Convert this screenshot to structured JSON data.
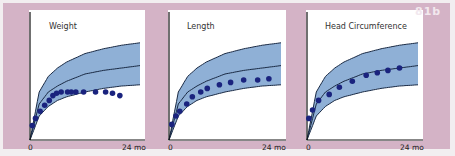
{
  "figure": {
    "tag": "81b",
    "colors": {
      "background": "#d4b3c6",
      "band": "#8fb0d6",
      "curve": "#1a2a44",
      "dots": "#1a237e",
      "plot_bg": "#ffffff"
    }
  },
  "chart_data": [
    {
      "type": "line",
      "title": "Weight",
      "xlabel": "",
      "x_ticks": [
        "0",
        "24 mo"
      ],
      "xlim": [
        0,
        24
      ],
      "ylabel": "",
      "grid": false,
      "legend": "none",
      "series": [
        {
          "name": "upper percentile",
          "x": [
            0,
            2,
            4,
            6,
            8,
            12,
            16,
            20,
            24
          ],
          "y": [
            0,
            40,
            53,
            60,
            65,
            72,
            76,
            79,
            81
          ]
        },
        {
          "name": "median",
          "x": [
            0,
            2,
            4,
            6,
            8,
            12,
            16,
            20,
            24
          ],
          "y": [
            0,
            30,
            40,
            45,
            49,
            55,
            58,
            60,
            62
          ]
        },
        {
          "name": "lower percentile",
          "x": [
            0,
            2,
            4,
            6,
            8,
            12,
            16,
            20,
            24
          ],
          "y": [
            0,
            20,
            28,
            33,
            36,
            40,
            43,
            45,
            46
          ]
        },
        {
          "name": "patient measurements",
          "kind": "scatter",
          "x": [
            0.5,
            1.2,
            2.2,
            3.2,
            4.2,
            5.0,
            5.8,
            6.8,
            8.2,
            9.0,
            10.0,
            11.7,
            14.3,
            16.5,
            18.0,
            19.6
          ],
          "y": [
            12,
            18,
            24,
            29,
            33,
            37,
            39,
            40,
            40,
            40,
            40,
            40,
            40,
            40,
            39,
            37
          ]
        }
      ],
      "band": "shaded region between upper and lower percentile"
    },
    {
      "type": "line",
      "title": "Length",
      "xlabel": "",
      "x_ticks": [
        "0",
        "24 mo"
      ],
      "xlim": [
        0,
        24
      ],
      "grid": false,
      "legend": "none",
      "series": [
        {
          "name": "upper percentile",
          "x": [
            0,
            2,
            4,
            6,
            8,
            12,
            16,
            20,
            24
          ],
          "y": [
            0,
            40,
            53,
            60,
            65,
            72,
            76,
            79,
            81
          ]
        },
        {
          "name": "median",
          "x": [
            0,
            2,
            4,
            6,
            8,
            12,
            16,
            20,
            24
          ],
          "y": [
            0,
            30,
            40,
            45,
            49,
            55,
            58,
            60,
            62
          ]
        },
        {
          "name": "lower percentile",
          "x": [
            0,
            2,
            4,
            6,
            8,
            12,
            16,
            20,
            24
          ],
          "y": [
            0,
            20,
            28,
            33,
            36,
            40,
            43,
            45,
            46
          ]
        },
        {
          "name": "patient measurements",
          "kind": "scatter",
          "x": [
            0.6,
            1.5,
            2.3,
            3.8,
            5.0,
            6.8,
            8.2,
            10.8,
            13.2,
            16.0,
            19.0,
            21.4
          ],
          "y": [
            13,
            20,
            24,
            30,
            36,
            40,
            43,
            46,
            48,
            50,
            50,
            51
          ]
        }
      ],
      "band": "shaded region between upper and lower percentile"
    },
    {
      "type": "line",
      "title": "Head Circumference",
      "xlabel": "",
      "x_ticks": [
        "0",
        "24 mo"
      ],
      "xlim": [
        0,
        24
      ],
      "grid": false,
      "legend": "none",
      "series": [
        {
          "name": "upper percentile",
          "x": [
            0,
            2,
            4,
            6,
            8,
            12,
            16,
            20,
            24
          ],
          "y": [
            0,
            40,
            53,
            60,
            65,
            72,
            76,
            79,
            81
          ]
        },
        {
          "name": "median",
          "x": [
            0,
            2,
            4,
            6,
            8,
            12,
            16,
            20,
            24
          ],
          "y": [
            0,
            30,
            40,
            45,
            49,
            55,
            58,
            60,
            62
          ]
        },
        {
          "name": "lower percentile",
          "x": [
            0,
            2,
            4,
            6,
            8,
            12,
            16,
            20,
            24
          ],
          "y": [
            0,
            20,
            28,
            33,
            36,
            40,
            43,
            45,
            46
          ]
        },
        {
          "name": "patient measurements",
          "kind": "scatter",
          "x": [
            0.4,
            1.2,
            2.5,
            4.8,
            7.0,
            9.8,
            12.8,
            15.2,
            17.5,
            20.0
          ],
          "y": [
            18,
            25,
            33,
            38,
            44,
            49,
            54,
            56,
            58,
            60
          ]
        }
      ],
      "band": "shaded region between upper and lower percentile"
    }
  ]
}
